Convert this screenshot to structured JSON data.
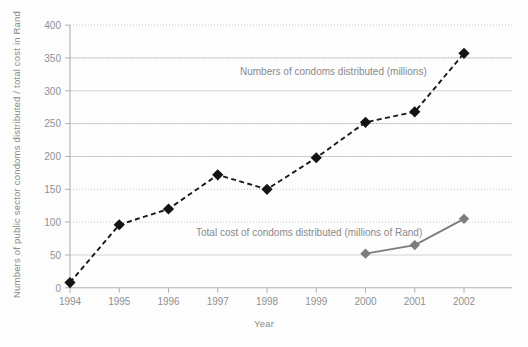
{
  "chart_data": {
    "type": "line",
    "title": "",
    "xlabel": "Year",
    "ylabel": "Numbers of public sector condoms distributed / total cost in Rand",
    "x": [
      "1994",
      "1995",
      "1996",
      "1997",
      "1998",
      "1999",
      "2000",
      "2001",
      "2002"
    ],
    "xlim": [
      1994,
      2002
    ],
    "ylim": [
      0,
      400
    ],
    "yticks": [
      "0",
      "50",
      "100",
      "150",
      "200",
      "250",
      "300",
      "350",
      "400"
    ],
    "ytick_values": [
      0,
      50,
      100,
      150,
      200,
      250,
      300,
      350,
      400
    ],
    "grid": true,
    "legend_position": "inline-annotation",
    "series": [
      {
        "name": "Numbers of condoms distributed (millions)",
        "style": "dashed",
        "marker": "diamond",
        "color": "#131313",
        "x": [
          "1994",
          "1995",
          "1996",
          "1997",
          "1998",
          "1999",
          "2000",
          "2001",
          "2002"
        ],
        "values": [
          8,
          96,
          120,
          172,
          150,
          198,
          252,
          268,
          357
        ]
      },
      {
        "name": "Total cost of condoms distributed (millions of Rand)",
        "style": "solid",
        "marker": "diamond",
        "color": "#7d7d7d",
        "x": [
          "2000",
          "2001",
          "2002"
        ],
        "values": [
          52,
          65,
          105
        ]
      }
    ],
    "annotations": [
      {
        "text": "Numbers of condoms distributed (millions)",
        "x": 240,
        "y": 75,
        "anchor": "start"
      },
      {
        "text": "Total cost of condoms distributed (millions of Rand)",
        "x": 196,
        "y": 236,
        "anchor": "start"
      }
    ]
  },
  "axes": {
    "y_title": "Numbers of public sector condoms distributed / total cost in Rand",
    "x_title": "Year"
  },
  "colors": {
    "series_primary": "#131313",
    "series_secondary": "#7d7d7d",
    "grid": "#c9c9c9",
    "text": "#8a8a8a",
    "background": "#fdfdfd"
  }
}
